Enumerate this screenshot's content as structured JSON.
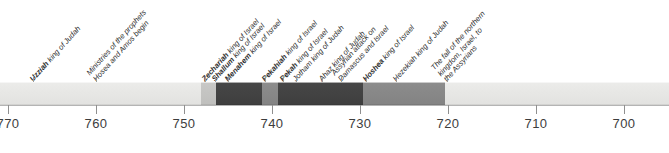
{
  "figure": {
    "type": "historical-timeline",
    "era_note": "BC dates decreasing left to right"
  },
  "axis": {
    "ticks": [
      {
        "label": "770",
        "value": 770,
        "x": 8
      },
      {
        "label": "760",
        "value": 760,
        "x": 96
      },
      {
        "label": "750",
        "value": 750,
        "x": 184
      },
      {
        "label": "740",
        "value": 740,
        "x": 272
      },
      {
        "label": "730",
        "value": 730,
        "x": 360
      },
      {
        "label": "720",
        "value": 720,
        "x": 448
      },
      {
        "label": "710",
        "value": 710,
        "x": 536
      },
      {
        "label": "700",
        "value": 700,
        "x": 624
      }
    ],
    "pixels_per_decade": 88,
    "direction": "descending"
  },
  "band": {
    "segments": [
      {
        "name": "pre-period",
        "tone": "base",
        "x": 0,
        "width": 201
      },
      {
        "name": "zechariah-reign",
        "tone": "light",
        "x": 201,
        "width": 11
      },
      {
        "name": "shallum-reign",
        "tone": "dark",
        "x": 212,
        "width": 5
      },
      {
        "name": "shallum-marker",
        "tone": "light",
        "x": 208,
        "width": 8
      },
      {
        "name": "menahem-reign",
        "tone": "dark",
        "x": 217,
        "width": 45
      },
      {
        "name": "pekahiah-reign",
        "tone": "mid",
        "x": 262,
        "width": 16
      },
      {
        "name": "pekah-reign",
        "tone": "dark",
        "x": 278,
        "width": 85
      },
      {
        "name": "hoshea-reign",
        "tone": "mid",
        "x": 363,
        "width": 82
      },
      {
        "name": "post-period",
        "tone": "base",
        "x": 445,
        "width": 224
      }
    ]
  },
  "events": [
    {
      "id": "uzziah",
      "name": "Uzziah",
      "rest": " king of Judah",
      "x": 33,
      "bold": true,
      "lines": [
        "Uzziah king of Judah"
      ]
    },
    {
      "id": "hosea-amos",
      "name": "",
      "rest": "",
      "x": 96,
      "bold": false,
      "lines": [
        "Ministries of the prophets",
        "Hosea and Amos begin"
      ]
    },
    {
      "id": "zechariah",
      "name": "Zechariah",
      "rest": " king of Israel",
      "x": 205,
      "bold": true,
      "lines": [
        "Zechariah king of Israel"
      ]
    },
    {
      "id": "shallum",
      "name": "Shallum",
      "rest": " king of Israel",
      "x": 215,
      "bold": true,
      "lines": [
        "Shallum king of Israel"
      ]
    },
    {
      "id": "menahem",
      "name": "Menahem",
      "rest": " king of Israel",
      "x": 228,
      "bold": true,
      "lines": [
        "Menahem king of Israel"
      ]
    },
    {
      "id": "pekahiah",
      "name": "Pekahiah",
      "rest": " king of Israel",
      "x": 265,
      "bold": true,
      "lines": [
        "Pekahiah king of Israel"
      ]
    },
    {
      "id": "pekah",
      "name": "Pekah",
      "rest": " king of Israel",
      "x": 283,
      "bold": true,
      "lines": [
        "Pekah king of Israel"
      ]
    },
    {
      "id": "jotham",
      "name": "",
      "rest": "",
      "x": 296,
      "bold": false,
      "lines": [
        "Jotham king of Judah"
      ]
    },
    {
      "id": "ahaz",
      "name": "",
      "rest": "",
      "x": 322,
      "bold": false,
      "lines": [
        "Ahaz king of Judah"
      ]
    },
    {
      "id": "assyrian-attack",
      "name": "",
      "rest": "",
      "x": 341,
      "bold": false,
      "lines": [
        "Assyrian attack on",
        "Damascus and Israel"
      ]
    },
    {
      "id": "hoshea",
      "name": "Hoshea",
      "rest": " king of Israel",
      "x": 366,
      "bold": true,
      "lines": [
        "Hoshea king of Israel"
      ]
    },
    {
      "id": "hezekiah",
      "name": "",
      "rest": "",
      "x": 396,
      "bold": false,
      "lines": [
        "Hezekiah king of Judah"
      ]
    },
    {
      "id": "fall-of-israel",
      "name": "",
      "rest": "",
      "x": 447,
      "bold": false,
      "lines": [
        "The fall of the northern",
        "kingdom, Israel, to",
        "the Assyrians"
      ]
    }
  ],
  "colors": {
    "band_base": "#e7e7e5",
    "band_dark": "#434343",
    "band_mid": "#888888",
    "band_light": "#c4c4c2",
    "axis": "#b4b4b4",
    "text": "#2f2f2f",
    "tick_text": "#3d3d3d"
  }
}
